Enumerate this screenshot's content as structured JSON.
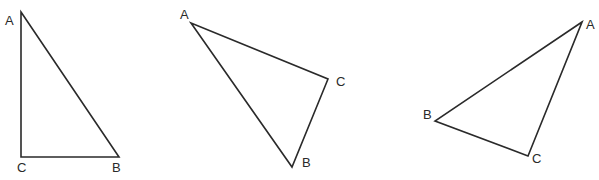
{
  "diagram": {
    "triangles": [
      {
        "id": "triangle-1",
        "vertices": {
          "A": {
            "x": 21,
            "y": 12,
            "label": "A",
            "lx": 5,
            "ly": 25
          },
          "B": {
            "x": 119,
            "y": 157,
            "label": "B",
            "lx": 112,
            "ly": 172
          },
          "C": {
            "x": 21,
            "y": 157,
            "label": "C",
            "lx": 17,
            "ly": 172
          }
        }
      },
      {
        "id": "triangle-2",
        "vertices": {
          "A": {
            "x": 191,
            "y": 23,
            "label": "A",
            "lx": 180,
            "ly": 19
          },
          "B": {
            "x": 292,
            "y": 167,
            "label": "B",
            "lx": 302,
            "ly": 167
          },
          "C": {
            "x": 328,
            "y": 79,
            "label": "C",
            "lx": 336,
            "ly": 86
          }
        }
      },
      {
        "id": "triangle-3",
        "vertices": {
          "A": {
            "x": 582,
            "y": 22,
            "label": "A",
            "lx": 586,
            "ly": 29
          },
          "B": {
            "x": 435,
            "y": 121,
            "label": "B",
            "lx": 423,
            "ly": 119
          },
          "C": {
            "x": 528,
            "y": 156,
            "label": "C",
            "lx": 532,
            "ly": 163
          }
        }
      }
    ],
    "stroke_color": "#2a2a2a",
    "background": "#ffffff"
  }
}
